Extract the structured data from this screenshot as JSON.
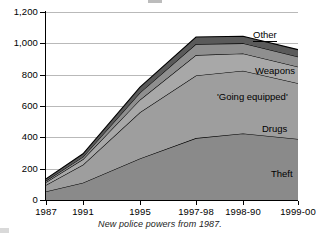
{
  "caption": "New police powers from 1987.",
  "chart_data": {
    "type": "area",
    "stacked": true,
    "title": "",
    "xlabel": "",
    "ylabel": "",
    "categories": [
      "1987",
      "1991",
      "1995",
      "1997-98",
      "1998-90",
      "1999-00"
    ],
    "ylim": [
      0,
      1200
    ],
    "yticks": [
      0,
      200,
      400,
      600,
      800,
      1000,
      1200
    ],
    "ytick_labels": [
      "0",
      "200",
      "400",
      "600",
      "800",
      "1,000",
      "1,200"
    ],
    "grid": true,
    "legend_position": "inline-right",
    "annotation": "New police powers from 1987.",
    "series": [
      {
        "name": "Theft",
        "label": "Theft",
        "color": "#8a8a8a",
        "values": [
          55,
          110,
          265,
          395,
          425,
          390
        ]
      },
      {
        "name": "Drugs",
        "label": "Drugs",
        "color": "#9e9e9e",
        "values": [
          40,
          115,
          295,
          400,
          400,
          355
        ]
      },
      {
        "name": "'Going equipped'",
        "label": "'Going equipped'",
        "color": "#a8a8a8",
        "values": [
          18,
          35,
          80,
          130,
          110,
          105
        ]
      },
      {
        "name": "Weapons",
        "label": "Weapons",
        "color": "#8f8f8f",
        "values": [
          10,
          15,
          45,
          70,
          65,
          65
        ]
      },
      {
        "name": "Other",
        "label": "Other",
        "color": "#5a5a5a",
        "values": [
          12,
          20,
          35,
          45,
          45,
          45
        ]
      }
    ],
    "totals": [
      135,
      295,
      720,
      1040,
      1045,
      960
    ]
  }
}
